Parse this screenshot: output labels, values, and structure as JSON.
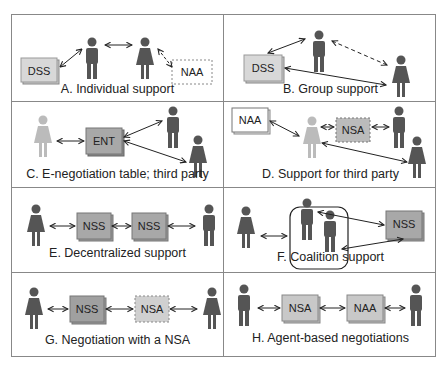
{
  "panels": [
    {
      "id": "A",
      "caption": "A. Individual support",
      "boxes": [
        "DSS",
        "NAA"
      ]
    },
    {
      "id": "B",
      "caption": "B. Group support",
      "boxes": [
        "DSS"
      ]
    },
    {
      "id": "C",
      "caption": "C. E-negotiation table; third party",
      "boxes": [
        "ENT"
      ]
    },
    {
      "id": "D",
      "caption": "D. Support for third party",
      "boxes": [
        "NAA",
        "NSA"
      ]
    },
    {
      "id": "E",
      "caption": "E. Decentralized support",
      "boxes": [
        "NSS",
        "NSS"
      ]
    },
    {
      "id": "F",
      "caption": "F. Coalition support",
      "boxes": [
        "NSS"
      ]
    },
    {
      "id": "G",
      "caption": "G. Negotiation with a NSA",
      "boxes": [
        "NSS",
        "NSA"
      ]
    },
    {
      "id": "H",
      "caption": "H. Agent-based negotiations",
      "boxes": [
        "NSA",
        "NAA"
      ]
    }
  ],
  "colors": {
    "person_dark": "#555555",
    "person_light": "#b8b8b8",
    "box_gray": "#a8a8a8",
    "box_light": "#d4d4d4",
    "border": "#888888"
  }
}
